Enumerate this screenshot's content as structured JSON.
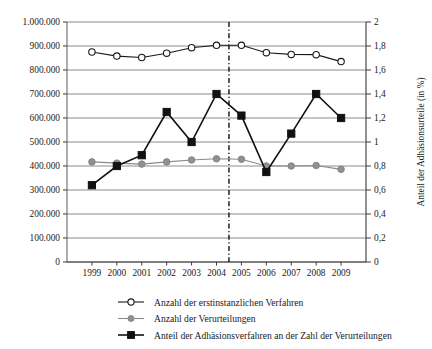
{
  "chart_data": {
    "type": "line",
    "title": "",
    "subtitle": "",
    "xlabel": "",
    "ylabel": "",
    "y2label": "Anteil der Adhäsionsurteile (in %)",
    "grid": true,
    "legend_position": "bottom-left",
    "categories": [
      "1999",
      "2000",
      "2001",
      "2002",
      "2003",
      "2004",
      "2005",
      "2006",
      "2007",
      "2008",
      "2009"
    ],
    "x": [
      1999,
      2000,
      2001,
      2002,
      2003,
      2004,
      2005,
      2006,
      2007,
      2008,
      2009
    ],
    "ylim": [
      0,
      1000000
    ],
    "ytick_values": [
      0,
      100000,
      200000,
      300000,
      400000,
      500000,
      600000,
      700000,
      800000,
      900000,
      1000000
    ],
    "ytick_labels": [
      "0",
      "100.000",
      "200.000",
      "300.000",
      "400.000",
      "500.000",
      "600.000",
      "700.000",
      "800.000",
      "900.000",
      "1.000.000"
    ],
    "y2lim": [
      0,
      2
    ],
    "y2tick_values": [
      0,
      0.2,
      0.4,
      0.6,
      0.8,
      1.0,
      1.2,
      1.4,
      1.6,
      1.8,
      2.0
    ],
    "y2tick_labels": [
      "0",
      "0,2",
      "0,4",
      "0,6",
      "0,8",
      "1",
      "1,2",
      "1,4",
      "1,6",
      "1,8",
      "2"
    ],
    "annotations": [
      {
        "type": "vline",
        "x": 2004.5,
        "style": "dash-dot",
        "label": ""
      }
    ],
    "series": [
      {
        "name": "Anzahl der erstinstanzlichen Verfahren",
        "axis": "left",
        "marker": "open-circle",
        "color": "#1a1a1a",
        "values": [
          875000,
          858000,
          852000,
          870000,
          893000,
          903000,
          903000,
          872000,
          865000,
          864000,
          835000
        ]
      },
      {
        "name": "Anzahl der Verurteilungen",
        "axis": "left",
        "marker": "filled-circle",
        "color": "#919191",
        "values": [
          417000,
          412000,
          408000,
          417000,
          425000,
          430000,
          428000,
          400000,
          400000,
          402000,
          386000
        ]
      },
      {
        "name": "Anteil der Adhäsionsverfahren an der Zahl der Verurteilungen",
        "axis": "right",
        "marker": "filled-square",
        "color": "#111111",
        "values": [
          0.64,
          0.8,
          0.89,
          1.25,
          1.0,
          1.4,
          1.22,
          0.75,
          1.07,
          1.4,
          1.2
        ]
      }
    ]
  },
  "legend": {
    "items": [
      {
        "label": "Anzahl der erstinstanzlichen Verfahren",
        "marker": "open-circle",
        "color": "#1a1a1a"
      },
      {
        "label": "Anzahl der Verurteilungen",
        "marker": "filled-circle",
        "color": "#919191"
      },
      {
        "label": "Anteil der Adhäsionsverfahren an der Zahl der Verurteilungen",
        "marker": "filled-square",
        "color": "#111111"
      }
    ]
  }
}
